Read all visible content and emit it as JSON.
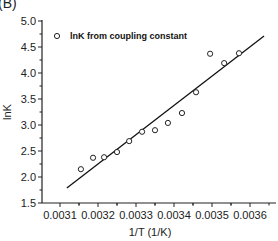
{
  "panel_label": "(B)",
  "chart_data": {
    "type": "scatter",
    "title": "",
    "xlabel": "1/T (1/K)",
    "ylabel": "lnK",
    "xlim": [
      0.00305,
      0.00369
    ],
    "ylim": [
      1.4,
      5.0
    ],
    "x_ticks": [
      "0.0031",
      "0.0032",
      "0.0033",
      "0.0034",
      "0.0035",
      "0.0036"
    ],
    "y_ticks": [
      "1.5",
      "2.0",
      "2.5",
      "3.0",
      "3.5",
      "4.0",
      "4.5",
      "5.0"
    ],
    "grid": false,
    "legend_position": "top-left",
    "series": [
      {
        "name": "lnK from coupling constant",
        "marker": "open-circle",
        "x": [
          0.003155,
          0.003187,
          0.003216,
          0.00325,
          0.003282,
          0.003316,
          0.00335,
          0.003384,
          0.003421,
          0.003458,
          0.003495,
          0.003532,
          0.003571
        ],
        "y": [
          2.15,
          2.37,
          2.38,
          2.48,
          2.69,
          2.87,
          2.9,
          3.04,
          3.23,
          3.63,
          4.37,
          4.19,
          4.38
        ]
      },
      {
        "name": "linear fit",
        "marker": "line",
        "x": [
          0.003118,
          0.003637
        ],
        "y": [
          1.79,
          4.71
        ]
      }
    ]
  },
  "legend": {
    "label": "lnK from coupling constant"
  },
  "colors": {
    "axis": "#222222",
    "marker": "#222222",
    "fit_line": "#111111"
  }
}
